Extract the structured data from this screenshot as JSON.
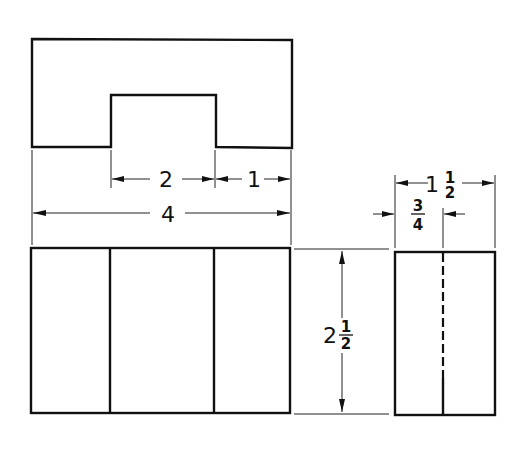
{
  "drawing": {
    "type": "orthographic-projection",
    "views": [
      "top-view",
      "front-view",
      "right-side-view"
    ],
    "dimensions": {
      "notch_width": {
        "whole": "2"
      },
      "right_ledge_width": {
        "whole": "1"
      },
      "overall_width": {
        "whole": "4"
      },
      "height": {
        "whole": "2",
        "num": "1",
        "den": "2"
      },
      "depth": {
        "whole": "1",
        "num": "1",
        "den": "2"
      },
      "half_depth": {
        "num": "3",
        "den": "4"
      }
    },
    "colors": {
      "line": "#111111",
      "background": "#ffffff"
    }
  }
}
